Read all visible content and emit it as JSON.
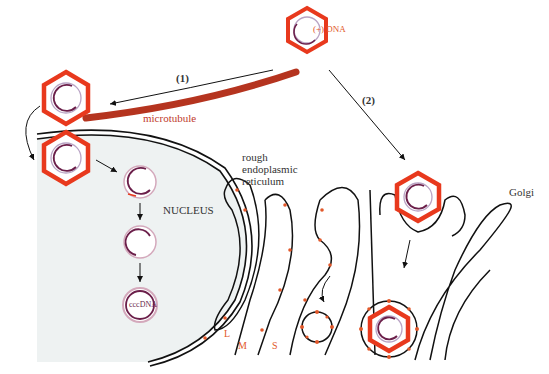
{
  "diagram": {
    "labels": {
      "dna": "(+) DNA",
      "path1": "(1)",
      "path2": "(2)",
      "microtubule": "microtubule",
      "nucleus": "NUCLEUS",
      "rer": "rough endoplasmic reticulum",
      "rer_line1": "rough",
      "rer_line2": "endoplasmic",
      "rer_line3": "reticulum",
      "golgi": "Golgi",
      "cccdna": "cccDNA",
      "protein_l": "L",
      "protein_m": "M",
      "protein_s": "S"
    },
    "colors": {
      "capsid": "#e8391d",
      "microtubule": "#b5341f",
      "nucleus_fill": "#eef2f2",
      "dna_strand": "#6b1f4a",
      "membrane": "#111111",
      "surface_protein": "#e2582a"
    }
  }
}
